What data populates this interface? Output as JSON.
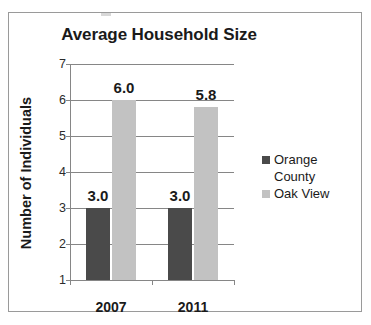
{
  "chart_data": {
    "type": "bar",
    "title": "Average Household Size",
    "xlabel": "",
    "ylabel": "Number of Individuals",
    "categories": [
      "2007",
      "2011"
    ],
    "series": [
      {
        "name": "Orange County",
        "values": [
          3.0,
          3.0
        ],
        "color": "#4a4a4a"
      },
      {
        "name": "Oak View",
        "values": [
          6.0,
          5.8
        ],
        "color": "#c2c2c2"
      }
    ],
    "data_labels": [
      [
        "3.0",
        "6.0"
      ],
      [
        "3.0",
        "5.8"
      ]
    ],
    "ylim": [
      1,
      7
    ],
    "yticks": [
      7,
      6,
      5,
      4,
      3,
      2,
      1
    ],
    "ytick_labels": [
      "7",
      "6",
      "5",
      "4",
      "3",
      "2",
      "1"
    ],
    "grid": true,
    "legend_position": "right",
    "legend_entries": [
      {
        "label_line1": "Orange",
        "label_line2": "County",
        "color": "#4a4a4a"
      },
      {
        "label_line1": "Oak View",
        "label_line2": "",
        "color": "#c2c2c2"
      }
    ]
  },
  "frame": {
    "border_color": "#9a9a9a"
  }
}
